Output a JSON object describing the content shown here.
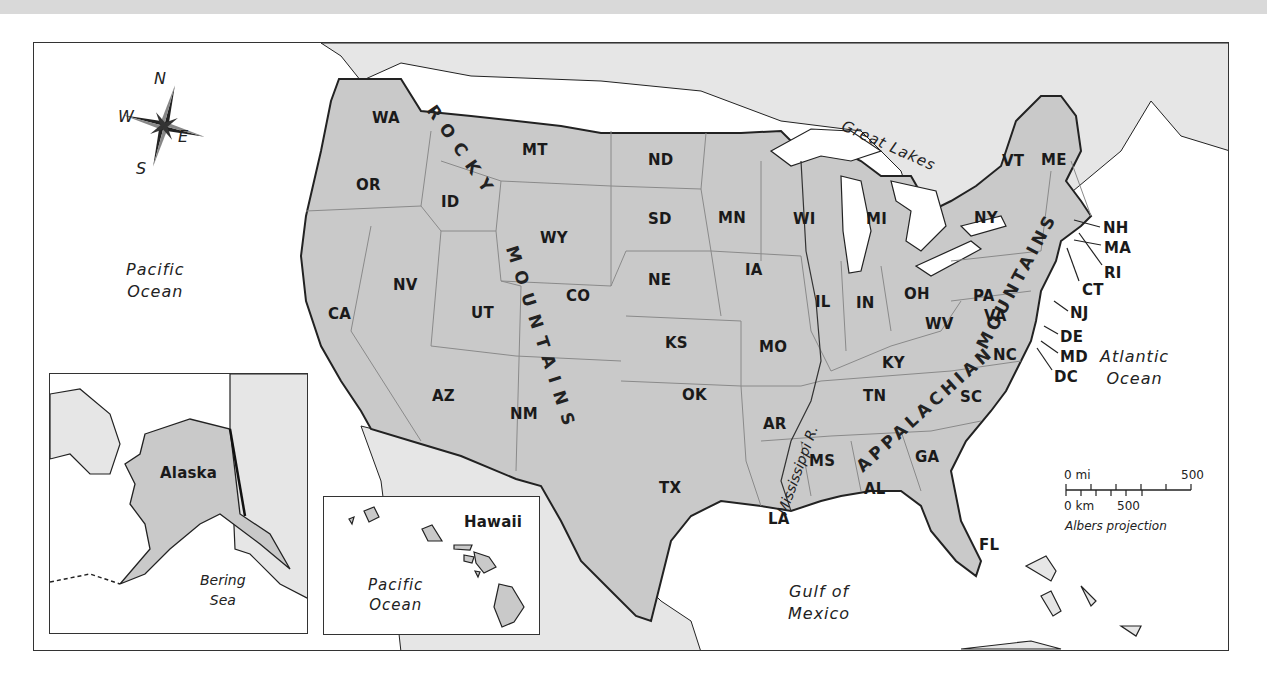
{
  "map": {
    "type": "United States political/physical reference map",
    "projection_label": "Albers projection",
    "compass": {
      "n": "N",
      "e": "E",
      "s": "S",
      "w": "W"
    },
    "scale": {
      "miles_start": "0 mi",
      "miles_end": "500",
      "km_start": "0 km",
      "km_mid": "500"
    },
    "water_bodies": {
      "pacific_main": [
        "Pacific",
        "Ocean"
      ],
      "atlantic": [
        "Atlantic",
        "Ocean"
      ],
      "gulf": [
        "Gulf of",
        "Mexico"
      ],
      "great_lakes": "Great Lakes",
      "bering": [
        "Bering",
        "Sea"
      ],
      "pacific_hawaii": [
        "Pacific",
        "Ocean"
      ]
    },
    "physical_features": {
      "rocky": "ROCKY",
      "mountains_west": "MOUNTAINS",
      "appalachian": "APPALACHIAN",
      "mountains_east": "MOUNTAINS",
      "river": "Mississippi R."
    },
    "insets": {
      "alaska": "Alaska",
      "hawaii": "Hawaii"
    },
    "states": {
      "WA": "WA",
      "OR": "OR",
      "CA": "CA",
      "ID": "ID",
      "NV": "NV",
      "UT": "UT",
      "AZ": "AZ",
      "MT": "MT",
      "WY": "WY",
      "CO": "CO",
      "NM": "NM",
      "ND": "ND",
      "SD": "SD",
      "NE": "NE",
      "KS": "KS",
      "OK": "OK",
      "TX": "TX",
      "MN": "MN",
      "IA": "IA",
      "MO": "MO",
      "AR": "AR",
      "LA": "LA",
      "WI": "WI",
      "IL": "IL",
      "MI": "MI",
      "IN": "IN",
      "OH": "OH",
      "KY": "KY",
      "TN": "TN",
      "MS": "MS",
      "AL": "AL",
      "GA": "GA",
      "FL": "FL",
      "SC": "SC",
      "NC": "NC",
      "VA": "VA",
      "WV": "WV",
      "PA": "PA",
      "NY": "NY",
      "VT": "VT",
      "ME": "ME",
      "NH": "NH",
      "MA": "MA",
      "RI": "RI",
      "CT": "CT",
      "NJ": "NJ",
      "DE": "DE",
      "MD": "MD",
      "DC": "DC"
    },
    "colors": {
      "land_us": "#c9c9c9",
      "land_foreign": "#e6e6e6",
      "water": "#ffffff",
      "border": "#222222",
      "state_line": "#8a8a8a"
    }
  }
}
